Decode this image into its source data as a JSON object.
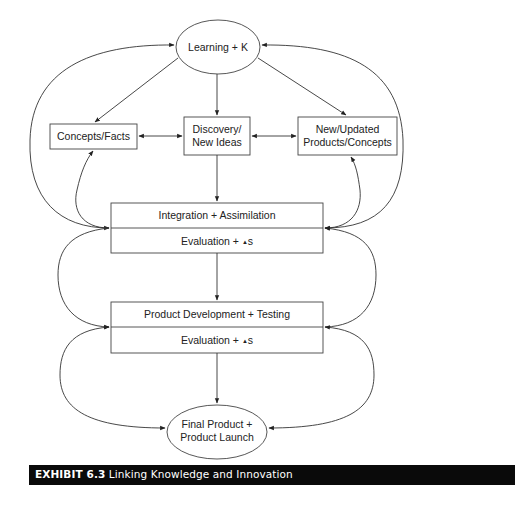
{
  "diagram": {
    "nodes": {
      "learning": {
        "label": "Learning + K",
        "shape": "ellipse"
      },
      "concepts": {
        "label": "Concepts/Facts",
        "shape": "box"
      },
      "discovery": {
        "line1": "Discovery/",
        "line2": "New Ideas",
        "shape": "box"
      },
      "new_products": {
        "line1": "New/Updated",
        "line2": "Products/Concepts",
        "shape": "box"
      },
      "integration": {
        "top": "Integration + Assimilation",
        "bottom_prefix": "Evaluation + ",
        "bottom_suffix": "s",
        "delta_symbol": "▲",
        "shape": "split-box"
      },
      "product_dev": {
        "top": "Product Development + Testing",
        "bottom_prefix": "Evaluation + ",
        "bottom_suffix": "s",
        "delta_symbol": "▲",
        "shape": "split-box"
      },
      "final": {
        "line1": "Final Product +",
        "line2": "Product Launch",
        "shape": "ellipse"
      }
    },
    "edges": [
      {
        "from": "learning",
        "to": "concepts",
        "type": "arrow"
      },
      {
        "from": "learning",
        "to": "discovery",
        "type": "arrow"
      },
      {
        "from": "learning",
        "to": "new_products",
        "type": "arrow"
      },
      {
        "from": "concepts",
        "to": "discovery",
        "type": "bidirectional"
      },
      {
        "from": "discovery",
        "to": "new_products",
        "type": "bidirectional"
      },
      {
        "from": "discovery",
        "to": "integration",
        "type": "arrow"
      },
      {
        "from": "integration",
        "to": "product_dev",
        "type": "arrow"
      },
      {
        "from": "product_dev",
        "to": "final",
        "type": "arrow"
      },
      {
        "from": "integration",
        "to": "learning",
        "type": "curved-bidirectional",
        "side": "left"
      },
      {
        "from": "integration",
        "to": "learning",
        "type": "curved-bidirectional",
        "side": "right"
      },
      {
        "from": "integration",
        "to": "concepts",
        "type": "curved-arrow",
        "side": "left"
      },
      {
        "from": "integration",
        "to": "new_products",
        "type": "curved-arrow",
        "side": "right"
      },
      {
        "from": "integration",
        "to": "product_dev",
        "type": "curved-loop",
        "side": "left"
      },
      {
        "from": "integration",
        "to": "product_dev",
        "type": "curved-loop",
        "side": "right"
      },
      {
        "from": "product_dev",
        "to": "final",
        "type": "curved-loop",
        "side": "left"
      },
      {
        "from": "product_dev",
        "to": "final",
        "type": "curved-loop",
        "side": "right"
      }
    ],
    "colors": {
      "line": "#333333",
      "text": "#222222",
      "caption_bg": "#0a0a0a",
      "caption_text": "#ffffff"
    }
  },
  "caption": {
    "label": "EXHIBIT 6.3",
    "title": "Linking Knowledge and Innovation"
  }
}
